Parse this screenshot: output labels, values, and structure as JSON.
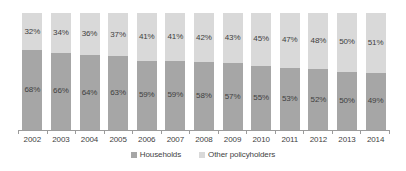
{
  "chart_data": {
    "type": "bar",
    "stacked": true,
    "normalized_100pct": true,
    "title": "",
    "subtitle": "",
    "xlabel": "",
    "ylabel": "",
    "ylim": [
      0,
      100
    ],
    "grid": false,
    "legend_position": "bottom",
    "categories": [
      "2002",
      "2003",
      "2004",
      "2005",
      "2006",
      "2007",
      "2008",
      "2009",
      "2010",
      "2011",
      "2012",
      "2013",
      "2014"
    ],
    "series": [
      {
        "name": "Households",
        "color": "#a6a6a6",
        "values": [
          68,
          66,
          64,
          63,
          59,
          59,
          58,
          57,
          55,
          53,
          52,
          50,
          49
        ],
        "labels": [
          "68%",
          "66%",
          "64%",
          "63%",
          "59%",
          "59%",
          "58%",
          "57%",
          "55%",
          "53%",
          "52%",
          "50%",
          "49%"
        ]
      },
      {
        "name": "Other policyholders",
        "color": "#d9d9d9",
        "values": [
          32,
          34,
          36,
          37,
          41,
          41,
          42,
          43,
          45,
          47,
          48,
          50,
          51
        ],
        "labels": [
          "32%",
          "34%",
          "36%",
          "37%",
          "41%",
          "41%",
          "42%",
          "43%",
          "45%",
          "47%",
          "48%",
          "50%",
          "51%"
        ]
      }
    ]
  },
  "legend": {
    "items": [
      {
        "label": "Households",
        "color": "#a6a6a6"
      },
      {
        "label": "Other policyholders",
        "color": "#d9d9d9"
      }
    ]
  },
  "axis": {
    "line_color": "#9b9b9b"
  }
}
